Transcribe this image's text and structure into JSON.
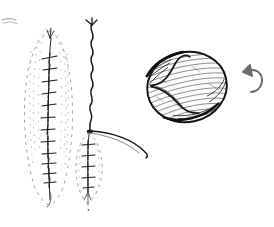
{
  "figure": {
    "medium": "ink on white paper",
    "background_color": "#ffffff",
    "ink_color": "#1a1a1a",
    "faint_ink_color": "#9a9a9a",
    "canvas": {
      "width": 274,
      "height": 227
    }
  },
  "specimens": [
    {
      "id": "specimen-1",
      "name": "elongated-catkin-left",
      "description": "Narrow elongated catkin/spike with stippled dashed outline and a central axis bearing paired cross-tick bracts",
      "outline_style": "stippled-dashed",
      "bbox": {
        "x": 22,
        "y": 26,
        "width": 56,
        "height": 182
      },
      "axis": {
        "x": 50,
        "y_top": 40,
        "y_bottom": 200
      },
      "bract_count": 14,
      "tip": "tapered point at bottom"
    },
    {
      "id": "specimen-2",
      "name": "wavy-stem-with-catkin",
      "description": "Long wavy vertical stem ending in a node, below which hangs a small stippled catkin; a curved arching branch sweeps to the right from the node",
      "stem": {
        "x": 92,
        "y_top": 22,
        "y_bottom": 130,
        "style": "wavy"
      },
      "node": {
        "x": 90,
        "y": 131
      },
      "catkin": {
        "x": 74,
        "y": 132,
        "width": 32,
        "height": 72
      },
      "arc_branch": {
        "from_x": 91,
        "from_y": 131,
        "to_x": 147,
        "to_y": 156
      },
      "bract_count": 8
    },
    {
      "id": "specimen-3",
      "name": "seed-bean-shaded",
      "description": "Rounded bean-like seed rendered with dense cross-hatching, dark rim and a pale S-shaped internal ridge (hilum)",
      "bbox": {
        "x": 147,
        "y": 48,
        "width": 80,
        "height": 78
      },
      "rotation_deg": -12,
      "shading": "hatched",
      "internal_feature": "s-curve-ridge"
    }
  ],
  "annotations": [
    {
      "id": "rotate-arrow",
      "name": "rotate-arrow-icon",
      "description": "Small hand-drawn curved arrow indicating rotation, arrowhead points up-left",
      "position": {
        "x": 240,
        "y": 64
      },
      "size": {
        "width": 24,
        "height": 30
      },
      "color": "#6b6b6b"
    },
    {
      "id": "corner-smudge",
      "name": "paper-smudge",
      "description": "Faint pencil smudge at upper-left margin",
      "position": {
        "x": 4,
        "y": 17
      },
      "color": "#d8d8d8"
    }
  ],
  "labels": {
    "has_text": false,
    "caption": ""
  }
}
